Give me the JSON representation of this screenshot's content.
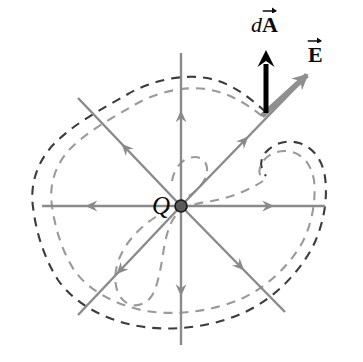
{
  "figure": {
    "kind": "physics-diagram",
    "background_color": "#ffffff",
    "canvas": {
      "width": 363,
      "height": 362
    }
  },
  "labels": {
    "charge": "Q",
    "area_element_prefix": "d",
    "area_element_symbol": "A",
    "field_symbol": "E"
  },
  "colors": {
    "field_line": "#8a8a8a",
    "outer_surface": "#3b3b3b",
    "inner_surface": "#9a9a9a",
    "charge_dot_fill": "#5a5a5a",
    "charge_dot_stroke": "#1a1a1a",
    "da_vector": "#000000",
    "e_vector": "#8f8f8f",
    "text": "#0a0a0a"
  },
  "geometry": {
    "charge_position": {
      "x": 181,
      "y": 206
    },
    "charge_dot_radius": 6,
    "field_lines": [
      {
        "name": "right",
        "x1": 181,
        "y1": 206,
        "x2": 325,
        "y2": 206,
        "arrow_at": 0.62
      },
      {
        "name": "left",
        "x1": 181,
        "y1": 206,
        "x2": 42,
        "y2": 206,
        "arrow_at": 0.66
      },
      {
        "name": "up",
        "x1": 181,
        "y1": 206,
        "x2": 181,
        "y2": 53,
        "arrow_at": 0.6
      },
      {
        "name": "down",
        "x1": 181,
        "y1": 206,
        "x2": 181,
        "y2": 345,
        "arrow_at": 0.62
      },
      {
        "name": "up-right",
        "x1": 181,
        "y1": 206,
        "x2": 305,
        "y2": 78,
        "arrow_at": 0.52
      },
      {
        "name": "up-left",
        "x1": 181,
        "y1": 206,
        "x2": 78,
        "y2": 98,
        "arrow_at": 0.55
      },
      {
        "name": "down-right",
        "x1": 181,
        "y1": 206,
        "x2": 285,
        "y2": 312,
        "arrow_at": 0.58
      },
      {
        "name": "down-left",
        "x1": 181,
        "y1": 206,
        "x2": 78,
        "y2": 315,
        "arrow_at": 0.6
      }
    ],
    "da_vector": {
      "x1": 266,
      "y1": 113,
      "x2": 266,
      "y2": 50
    },
    "e_vector": {
      "x1": 262,
      "y1": 116,
      "x2": 307,
      "y2": 75
    },
    "outer_surface_path": "M 266 112 C 247 96 232 83 207 78 C 183 74 152 80 128 94 C 104 108 76 122 55 143 C 36 162 30 186 33 207 C 36 232 44 258 58 280 C 74 303 104 320 138 326 C 172 332 212 327 243 313 C 272 300 296 276 311 250 C 324 226 328 198 325 177 C 322 158 312 147 299 143 C 286 139 273 144 266 152 C 259 160 260 168 266 176",
    "inner_surface_path": "M 262 116 C 244 102 229 93 206 89 C 184 86 157 92 136 104 C 114 117 89 130 70 149 C 54 166 49 187 52 206 C 55 228 62 251 74 270 C 88 290 115 305 146 311 C 177 316 213 311 241 299 C 267 287 289 266 302 243 C 313 222 316 198 314 180 C 311 164 303 155 292 152 C 281 149 270 153 264 160 C 258 167 258 174 263 181",
    "inner_lobe_path": "M 263 181 C 251 189 233 197 212 201 C 197 203 186 206 179 212 C 171 219 167 231 164 248 C 161 267 158 287 151 297 C 143 307 131 308 123 300 C 115 292 113 277 118 262 C 124 244 138 229 154 218 C 170 207 183 200 193 193 C 202 186 208 177 207 168 C 206 159 198 155 189 158 C 180 161 174 170 172 181"
  }
}
